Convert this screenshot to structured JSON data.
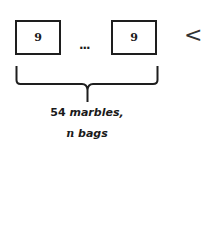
{
  "diagram": {
    "bags": [
      {
        "label": "9"
      },
      {
        "label": "9"
      }
    ],
    "ellipsis": "...",
    "comparison_symbol": "<",
    "caption": {
      "line1_number": "54",
      "line1_text": " marbles,",
      "line2_var": "n",
      "line2_text": " bags"
    },
    "colors": {
      "stroke": "#1e1e1e",
      "background": "#ffffff"
    }
  }
}
